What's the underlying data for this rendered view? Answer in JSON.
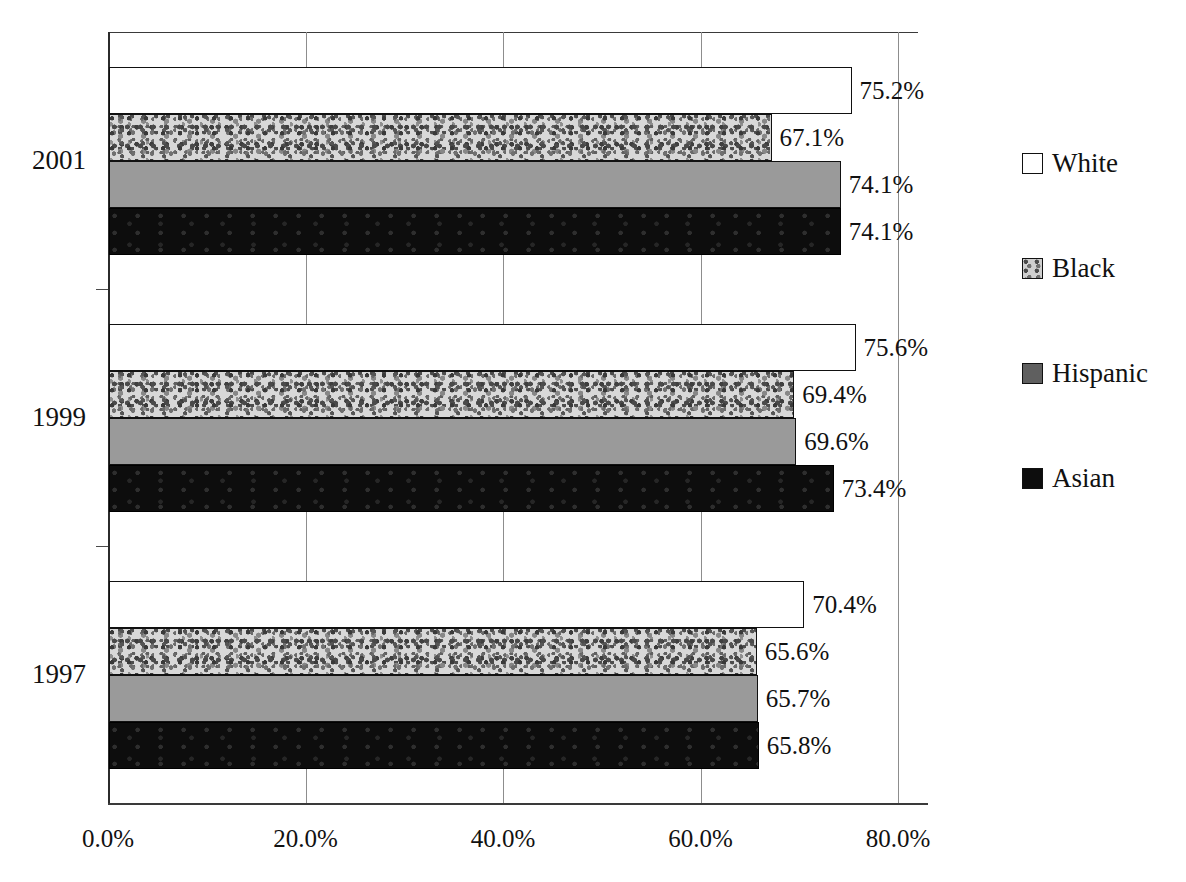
{
  "chart_data": {
    "type": "bar",
    "orientation": "horizontal",
    "title": "",
    "subtitle": "",
    "xlabel": "",
    "ylabel": "",
    "categories": [
      "2001",
      "1999",
      "1997"
    ],
    "series": [
      {
        "name": "White",
        "values": [
          75.2,
          75.6,
          70.4
        ],
        "swatch": "white"
      },
      {
        "name": "Black",
        "values": [
          67.1,
          69.4,
          65.6
        ],
        "swatch": "speckled-gray"
      },
      {
        "name": "Hispanic",
        "values": [
          74.1,
          69.6,
          65.7
        ],
        "swatch": "medium-gray"
      },
      {
        "name": "Asian",
        "values": [
          74.1,
          73.4,
          65.8
        ],
        "swatch": "black"
      }
    ],
    "data_labels": {
      "2001": [
        "75.2%",
        "67.1%",
        "74.1%",
        "74.1%"
      ],
      "1999": [
        "75.6%",
        "69.4%",
        "69.6%",
        "73.4%"
      ],
      "1997": [
        "70.4%",
        "65.6%",
        "65.7%",
        "65.8%"
      ]
    },
    "xlim": [
      0,
      80
    ],
    "xticks": [
      0,
      20,
      40,
      60,
      80
    ],
    "xtick_labels": [
      "0.0%",
      "20.0%",
      "40.0%",
      "60.0%",
      "80.0%"
    ],
    "grid": "vertical-only",
    "legend_position": "right"
  },
  "axis": {
    "ticks": [
      {
        "label": "0.0%",
        "value": 0
      },
      {
        "label": "20.0%",
        "value": 20
      },
      {
        "label": "40.0%",
        "value": 40
      },
      {
        "label": "60.0%",
        "value": 60
      },
      {
        "label": "80.0%",
        "value": 80
      }
    ]
  },
  "groups": [
    {
      "category": "2001",
      "bars": [
        {
          "series": "White",
          "value": 75.2,
          "label": "75.2%"
        },
        {
          "series": "Black",
          "value": 67.1,
          "label": "67.1%"
        },
        {
          "series": "Hispanic",
          "value": 74.1,
          "label": "74.1%"
        },
        {
          "series": "Asian",
          "value": 74.1,
          "label": "74.1%"
        }
      ]
    },
    {
      "category": "1999",
      "bars": [
        {
          "series": "White",
          "value": 75.6,
          "label": "75.6%"
        },
        {
          "series": "Black",
          "value": 69.4,
          "label": "69.4%"
        },
        {
          "series": "Hispanic",
          "value": 69.6,
          "label": "69.6%"
        },
        {
          "series": "Asian",
          "value": 73.4,
          "label": "73.4%"
        }
      ]
    },
    {
      "category": "1997",
      "bars": [
        {
          "series": "White",
          "value": 70.4,
          "label": "70.4%"
        },
        {
          "series": "Black",
          "value": 65.6,
          "label": "65.6%"
        },
        {
          "series": "Hispanic",
          "value": 65.7,
          "label": "65.7%"
        },
        {
          "series": "Asian",
          "value": 65.8,
          "label": "65.8%"
        }
      ]
    }
  ],
  "legend": {
    "items": [
      {
        "label": "White",
        "swatch": "white"
      },
      {
        "label": "Black",
        "swatch": "speckled-gray"
      },
      {
        "label": "Hispanic",
        "swatch": "medium-gray"
      },
      {
        "label": "Asian",
        "swatch": "black"
      }
    ]
  },
  "colors": {
    "white_bar": "#ffffff",
    "black_bar_base": "#d8d8d8",
    "hispanic_bar": "#9a9a9a",
    "asian_bar": "#0d0d0d",
    "outline": "#111111",
    "gridline": "#8d8d8d",
    "axis": "#2b2b2b",
    "text": "#111111",
    "background": "#ffffff"
  }
}
